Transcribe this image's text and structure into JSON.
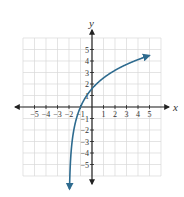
{
  "chart_data": {
    "type": "line",
    "title": "",
    "xlabel": "x",
    "ylabel": "y",
    "xlim": [
      -6,
      6
    ],
    "ylim": [
      -6,
      6
    ],
    "grid": true,
    "x_ticks": [
      -5,
      -4,
      -3,
      -2,
      -1,
      1,
      2,
      3,
      4,
      5
    ],
    "y_ticks": [
      -5,
      -4,
      -3,
      -2,
      -1,
      1,
      2,
      3,
      4,
      5
    ],
    "x_tick_labels": [
      "−5",
      "−4",
      "−3",
      "−2",
      "−1",
      "1",
      "2",
      "3",
      "4",
      "5"
    ],
    "y_tick_labels": [
      "−5",
      "−4",
      "−3",
      "−2",
      "−1",
      "1",
      "2",
      "3",
      "4",
      "5"
    ],
    "series": [
      {
        "name": "logarithmic curve",
        "color": "#2e6b8f",
        "vertical_asymptote": -2,
        "points": [
          {
            "x": -1.95,
            "y": -5
          },
          {
            "x": -1.8,
            "y": -3.7
          },
          {
            "x": -1.5,
            "y": -1.6
          },
          {
            "x": -1,
            "y": 0
          },
          {
            "x": 0,
            "y": 1.6
          },
          {
            "x": 1,
            "y": 2.5
          },
          {
            "x": 2,
            "y": 3.2
          },
          {
            "x": 3,
            "y": 3.7
          },
          {
            "x": 4,
            "y": 4.1
          },
          {
            "x": 5,
            "y": 4.4
          }
        ],
        "arrows_at_ends": true
      }
    ],
    "legend": []
  },
  "colors": {
    "grid": "#d9d9d9",
    "axis": "#222222",
    "curve": "#2e6b8f"
  }
}
